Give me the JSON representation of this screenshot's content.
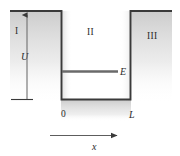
{
  "figure": {
    "type": "physics-potential-well-diagram",
    "colors": {
      "line": "#3a3a3a",
      "shading": "#d8d8d8",
      "background": "#ffffff",
      "text": "#2b2b2b"
    },
    "labels": {
      "region_I": "I",
      "region_II": "II",
      "region_III": "III",
      "potential_depth": "U",
      "energy_level": "E",
      "origin": "0",
      "well_width": "L",
      "axis_x": "x"
    }
  }
}
